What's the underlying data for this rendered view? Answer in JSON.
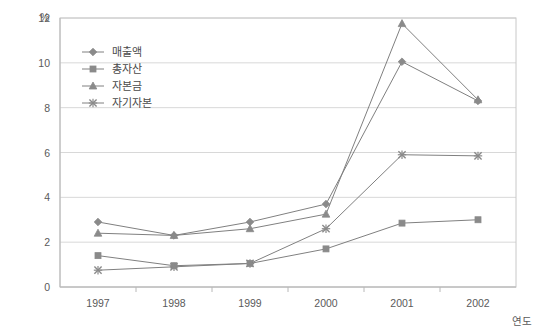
{
  "chart_data": {
    "type": "line",
    "title": "",
    "xlabel": "연도",
    "ylabel": "",
    "unit_label": "%",
    "categories": [
      "1997",
      "1998",
      "1999",
      "2000",
      "2001",
      "2002"
    ],
    "ylim": [
      0,
      12
    ],
    "ytick_step": 2,
    "yticks": [
      "0",
      "2",
      "4",
      "6",
      "8",
      "10",
      "12"
    ],
    "grid": true,
    "legend_position": "upper-left-inside",
    "series": [
      {
        "name": "매출액",
        "marker": "diamond",
        "color": "#808080",
        "values": [
          2.9,
          2.3,
          2.9,
          3.7,
          10.05,
          8.3
        ]
      },
      {
        "name": "총자산",
        "marker": "square",
        "color": "#808080",
        "values": [
          1.4,
          0.95,
          1.05,
          1.7,
          2.85,
          3.0
        ]
      },
      {
        "name": "자본금",
        "marker": "triangle",
        "color": "#808080",
        "values": [
          2.4,
          2.3,
          2.6,
          3.25,
          11.75,
          8.35
        ]
      },
      {
        "name": "자기자본",
        "marker": "cross",
        "color": "#808080",
        "values": [
          0.75,
          0.9,
          1.05,
          2.6,
          5.9,
          5.85
        ]
      }
    ]
  },
  "axis": {
    "y_unit": "%",
    "x_name": "연도"
  },
  "legend": {
    "items": [
      {
        "label": "매출액",
        "marker": "diamond-marker"
      },
      {
        "label": "총자산",
        "marker": "square-marker"
      },
      {
        "label": "자본금",
        "marker": "triangle-marker"
      },
      {
        "label": "자기자본",
        "marker": "cross-marker"
      }
    ]
  }
}
